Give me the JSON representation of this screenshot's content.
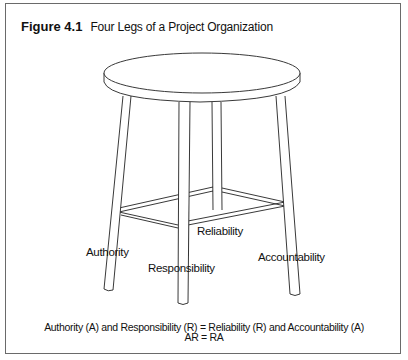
{
  "figure": {
    "number": "Figure 4.1",
    "title": "Four Legs of a Project Organization"
  },
  "legs": [
    {
      "id": "authority",
      "label": "Authority"
    },
    {
      "id": "responsibility",
      "label": "Responsibility"
    },
    {
      "id": "reliability",
      "label": "Reliability"
    },
    {
      "id": "accountability",
      "label": "Accountability"
    }
  ],
  "caption": {
    "line1": "Authority (A) and Responsibility (R) = Reliability (R) and Accountability (A)",
    "line2": "AR = RA"
  }
}
